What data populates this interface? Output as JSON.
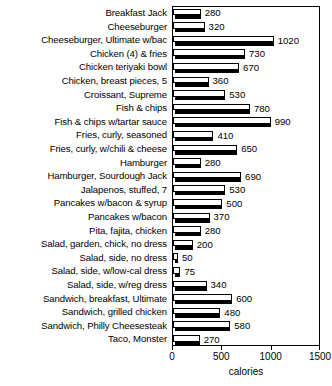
{
  "chart_data": {
    "type": "bar",
    "orientation": "horizontal",
    "title": "",
    "xlabel": "calories",
    "ylabel": "",
    "xlim": [
      0,
      1500
    ],
    "xticks": [
      0,
      500,
      1000,
      1500
    ],
    "xtick_labels": [
      "0",
      "500",
      "1000",
      "1500"
    ],
    "grid": false,
    "legend": false,
    "show_value_labels": true,
    "categories": [
      "Breakfast Jack",
      "Cheeseburger",
      "Cheeseburger, Ultimate w/bac",
      "Chicken (4) & fries",
      "Chicken teriyaki bowl",
      "Chicken, breast pieces, 5",
      "Croissant, Supreme",
      "Fish & chips",
      "Fish & chips w/tartar sauce",
      "Fries, curly, seasoned",
      "Fries, curly, w/chili & cheese",
      "Hamburger",
      "Hamburger, Sourdough Jack",
      "Jalapenos, stuffed, 7",
      "Pancakes w/bacon & syrup",
      "Pancakes w/bacon",
      "Pita, fajita, chicken",
      "Salad, garden, chick, no dress",
      "Salad, side, no dress",
      "Salad, side, w/low-cal dress",
      "Salad, side, w/reg dress",
      "Sandwich, breakfast, Ultimate",
      "Sandwich, grilled chicken",
      "Sandwich, Philly Cheesesteak",
      "Taco, Monster"
    ],
    "values": [
      280,
      320,
      1020,
      730,
      670,
      360,
      530,
      780,
      990,
      410,
      650,
      280,
      690,
      530,
      500,
      370,
      280,
      200,
      50,
      75,
      340,
      600,
      480,
      580,
      270
    ],
    "value_labels": [
      "280",
      "320",
      "1020",
      "730",
      "670",
      "360",
      "530",
      "780",
      "990",
      "410",
      "650",
      "280",
      "690",
      "530",
      "500",
      "370",
      "280",
      "200",
      "50",
      "75",
      "340",
      "600",
      "480",
      "580",
      "270"
    ],
    "colors": {
      "bar_face": "#ffffff",
      "bar_edge": "#000000",
      "bar_shadow": "#000000",
      "background": "#ffffff",
      "text": "#000000",
      "axis": "#000000"
    }
  }
}
